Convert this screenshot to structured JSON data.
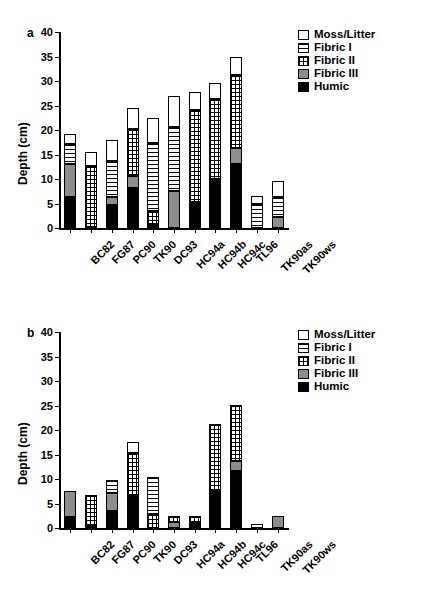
{
  "figure": {
    "panels": [
      "a",
      "b"
    ],
    "ylabel": "Depth (cm)",
    "yticks": [
      "0",
      "5",
      "10",
      "15",
      "20",
      "25",
      "30",
      "35",
      "40"
    ],
    "categories": [
      "BC82",
      "FG87",
      "PC90",
      "TK90",
      "DC93",
      "HC94a",
      "HC94b",
      "HC94c",
      "TL96",
      "TK90as",
      "TK90ws"
    ],
    "legend": [
      {
        "label": "Moss/Litter",
        "pattern": "f-moss"
      },
      {
        "label": "Fibric I",
        "pattern": "f-fib1"
      },
      {
        "label": "Fibric II",
        "pattern": "f-fib2"
      },
      {
        "label": "Fibric III",
        "pattern": "f-fib3"
      },
      {
        "label": "Humic",
        "pattern": "f-humic"
      }
    ]
  },
  "chart_data": [
    {
      "type": "bar",
      "subplot": "a",
      "stacked": true,
      "title": "",
      "xlabel": "",
      "ylabel": "Depth (cm)",
      "ylim": [
        0,
        40
      ],
      "ytick_step": 5,
      "grid": false,
      "legend_position": "top-right",
      "categories": [
        "BC82",
        "FG87",
        "PC90",
        "TK90",
        "DC93",
        "HC94a",
        "HC94b",
        "HC94c",
        "TL96",
        "TK90as",
        "TK90ws"
      ],
      "series": [
        {
          "name": "Humic",
          "values": [
            6.3,
            0.3,
            4.6,
            8.2,
            0.8,
            0.0,
            5.4,
            10.0,
            13.0,
            0.0,
            0.0
          ]
        },
        {
          "name": "Fibric III",
          "values": [
            6.7,
            0.0,
            1.7,
            2.4,
            0.0,
            7.6,
            0.0,
            0.0,
            3.3,
            0.0,
            2.3
          ]
        },
        {
          "name": "Fibric II",
          "values": [
            0.0,
            12.3,
            0.0,
            9.6,
            2.6,
            0.0,
            18.7,
            16.4,
            15.0,
            0.0,
            0.0
          ]
        },
        {
          "name": "Fibric I",
          "values": [
            4.2,
            0.0,
            7.4,
            0.0,
            14.0,
            13.0,
            0.0,
            0.0,
            0.0,
            5.0,
            4.1
          ]
        },
        {
          "name": "Moss/Litter",
          "values": [
            2.0,
            3.0,
            4.3,
            4.2,
            5.0,
            6.3,
            3.6,
            3.2,
            3.6,
            1.5,
            3.1
          ]
        }
      ],
      "totals": [
        19.2,
        15.6,
        18.0,
        24.4,
        22.4,
        26.9,
        27.7,
        29.6,
        34.9,
        6.5,
        9.5
      ]
    },
    {
      "type": "bar",
      "subplot": "b",
      "stacked": true,
      "title": "",
      "xlabel": "",
      "ylabel": "Depth (cm)",
      "ylim": [
        0,
        40
      ],
      "ytick_step": 5,
      "grid": false,
      "legend_position": "top-right",
      "categories": [
        "BC82",
        "FG87",
        "PC90",
        "TK90",
        "DC93",
        "HC94a",
        "HC94b",
        "HC94c",
        "TL96",
        "TK90as",
        "TK90ws"
      ],
      "series": [
        {
          "name": "Humic",
          "values": [
            2.2,
            0.7,
            3.4,
            6.6,
            0.0,
            0.0,
            1.0,
            7.6,
            11.6,
            0.0,
            0.0
          ]
        },
        {
          "name": "Fibric III",
          "values": [
            5.4,
            0.0,
            3.8,
            0.0,
            0.0,
            1.3,
            0.0,
            0.0,
            2.0,
            0.0,
            2.5
          ]
        },
        {
          "name": "Fibric II",
          "values": [
            0.0,
            6.0,
            0.0,
            8.7,
            2.8,
            1.2,
            1.4,
            13.6,
            11.5,
            0.0,
            0.0
          ]
        },
        {
          "name": "Fibric I",
          "values": [
            0.0,
            0.0,
            2.6,
            0.0,
            7.6,
            0.0,
            0.0,
            0.0,
            0.0,
            0.0,
            0.0
          ]
        },
        {
          "name": "Moss/Litter",
          "values": [
            0.0,
            0.0,
            0.0,
            2.2,
            0.0,
            0.0,
            0.0,
            0.0,
            0.0,
            0.9,
            0.0
          ]
        }
      ],
      "totals": [
        7.6,
        6.7,
        9.8,
        17.5,
        10.4,
        2.5,
        2.4,
        21.2,
        25.1,
        0.9,
        2.5
      ]
    }
  ]
}
